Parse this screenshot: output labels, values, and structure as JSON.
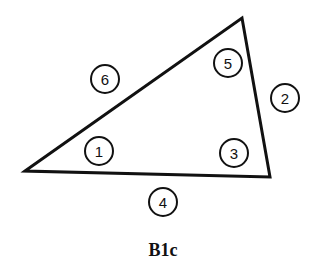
{
  "diagram": {
    "caption": "B1c",
    "vertices": [
      [
        25,
        171
      ],
      [
        242,
        18
      ],
      [
        270,
        177
      ]
    ],
    "labels": [
      {
        "id": "6",
        "text": "6",
        "cx": 105,
        "cy": 79
      },
      {
        "id": "5",
        "text": "5",
        "cx": 228,
        "cy": 63
      },
      {
        "id": "2",
        "text": "2",
        "cx": 285,
        "cy": 98
      },
      {
        "id": "1",
        "text": "1",
        "cx": 99,
        "cy": 151
      },
      {
        "id": "3",
        "text": "3",
        "cx": 234,
        "cy": 153
      },
      {
        "id": "4",
        "text": "4",
        "cx": 163,
        "cy": 202
      }
    ],
    "colors": {
      "stroke": "#111111",
      "background": "#ffffff"
    }
  }
}
